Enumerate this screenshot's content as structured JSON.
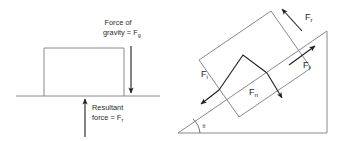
{
  "figure": {
    "background_color": "#ffffff",
    "line_color": "#8a8a8a",
    "arrow_color": "#1e1e1e",
    "text_color": "#2b2b2b"
  },
  "diagram_flat": {
    "name": "Block on level ground",
    "ground_label": "ground line",
    "block_label": "block",
    "gravity": {
      "line1": "Force of",
      "line2_prefix": "gravity = F",
      "subscript": "g",
      "direction": "down"
    },
    "resultant": {
      "line1": "Resultant",
      "line2_prefix": "force = F",
      "subscript": "r",
      "direction": "up"
    }
  },
  "diagram_incline": {
    "name": "Block on inclined plane",
    "ramp_label": "inclined plane",
    "block_label": "block on slope",
    "angle": {
      "symbol": "θ",
      "arc_label": "incline angle"
    },
    "forces": [
      {
        "id": "resultant",
        "prefix": "F",
        "subscript": "r",
        "direction": "up-left",
        "description": "Resultant force at top of block"
      },
      {
        "id": "friction",
        "prefix": "F",
        "subscript": "f",
        "direction": "up-slope",
        "description": "Friction force up the slope"
      },
      {
        "id": "incline",
        "prefix": "F",
        "subscript": "i",
        "direction": "down-slope",
        "description": "Component along the incline"
      },
      {
        "id": "normal",
        "prefix": "F",
        "subscript": "n",
        "direction": "into-surface",
        "description": "Normal component into the surface"
      }
    ]
  }
}
